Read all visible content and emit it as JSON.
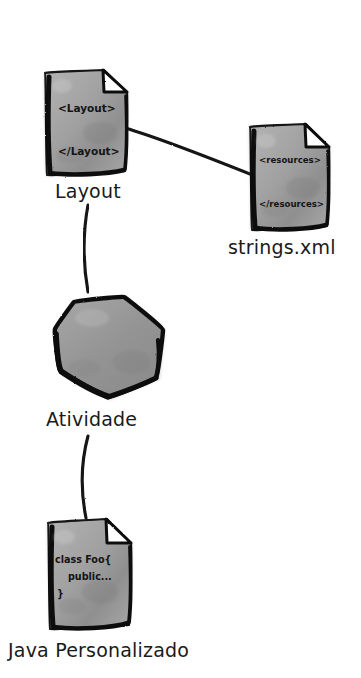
{
  "diagram": {
    "style": "hand-drawn sketch, grayscale",
    "background_color": "#ffffff",
    "ink_color": "#111111",
    "shape_fill_color": "#9a9a9a",
    "nodes": [
      {
        "id": "layout",
        "label": "Layout",
        "shape": "document",
        "icon_name": "xml-document-icon",
        "code_lines": [
          "<Layout>",
          "</Layout>"
        ],
        "label_x": 55,
        "label_y": 182
      },
      {
        "id": "strings",
        "label": "strings.xml",
        "shape": "document",
        "icon_name": "xml-document-icon",
        "code_lines": [
          "<resources>",
          "</resources>"
        ],
        "label_x": 228,
        "label_y": 238
      },
      {
        "id": "atividade",
        "label": "Atividade",
        "shape": "hexagon",
        "icon_name": "activity-hexagon-icon",
        "code_lines": [],
        "label_x": 46,
        "label_y": 410
      },
      {
        "id": "java",
        "label": "Java Personalizado",
        "shape": "document",
        "icon_name": "java-document-icon",
        "code_lines": [
          "class Foo{",
          "public...",
          "}"
        ],
        "label_x": 8,
        "label_y": 641
      }
    ],
    "edges": [
      {
        "from": "layout",
        "to": "strings",
        "kind": "curve"
      },
      {
        "from": "layout",
        "to": "atividade",
        "kind": "curve"
      },
      {
        "from": "atividade",
        "to": "java",
        "kind": "curve"
      }
    ]
  }
}
